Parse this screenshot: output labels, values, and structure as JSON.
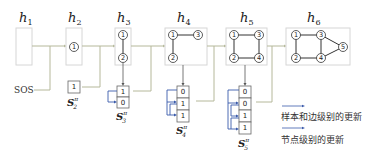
{
  "diagram": {
    "hidden_states": [
      {
        "label": "h",
        "index": "1"
      },
      {
        "label": "h",
        "index": "2"
      },
      {
        "label": "h",
        "index": "3"
      },
      {
        "label": "h",
        "index": "4"
      },
      {
        "label": "h",
        "index": "5"
      },
      {
        "label": "h",
        "index": "6"
      }
    ],
    "graphs": {
      "h2": {
        "nodes": [
          "1"
        ],
        "edges": []
      },
      "h3": {
        "nodes": [
          "1",
          "2"
        ],
        "edges": [
          [
            "1",
            "2"
          ]
        ]
      },
      "h4": {
        "nodes": [
          "1",
          "2",
          "3"
        ],
        "edges": [
          [
            "1",
            "3"
          ],
          [
            "1",
            "2"
          ]
        ]
      },
      "h5": {
        "nodes": [
          "1",
          "2",
          "3",
          "4"
        ],
        "edges": [
          [
            "1",
            "3"
          ],
          [
            "1",
            "2"
          ],
          [
            "3",
            "4"
          ],
          [
            "2",
            "4"
          ]
        ]
      },
      "h6": {
        "nodes": [
          "1",
          "2",
          "3",
          "4",
          "5"
        ],
        "edges": [
          [
            "1",
            "3"
          ],
          [
            "1",
            "2"
          ],
          [
            "3",
            "4"
          ],
          [
            "2",
            "4"
          ],
          [
            "3",
            "5"
          ],
          [
            "4",
            "5"
          ]
        ]
      }
    },
    "start_token": "SOS",
    "adjacency_vectors": [
      {
        "name": "S",
        "sup": "π",
        "sub": "2",
        "bits": [
          "1"
        ]
      },
      {
        "name": "S",
        "sup": "π",
        "sub": "3",
        "bits": [
          "1",
          "0"
        ]
      },
      {
        "name": "S",
        "sup": "π",
        "sub": "4",
        "bits": [
          "0",
          "1",
          "1"
        ]
      },
      {
        "name": "S",
        "sup": "π",
        "sub": "5",
        "bits": [
          "0",
          "0",
          "1",
          "1"
        ]
      }
    ],
    "legend": [
      {
        "label": "样本和边级别的更新",
        "color": "#3b5bab"
      },
      {
        "label": "节点级别的更新",
        "color": "#3b5bab"
      }
    ],
    "colors": {
      "connector": "#b5b89a",
      "edge_update": "#3b5bab",
      "frame": "#d6d6d6"
    }
  }
}
